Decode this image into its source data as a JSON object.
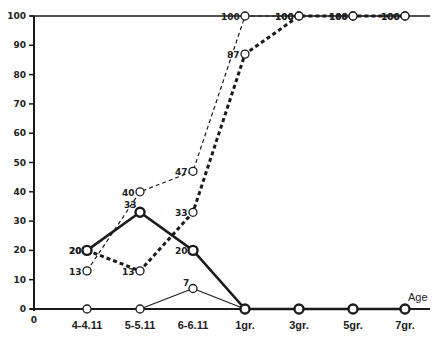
{
  "chart_data": {
    "type": "line",
    "title": "",
    "xlabel": "Age",
    "ylabel": "",
    "ylim": [
      0,
      100
    ],
    "yticks": [
      0,
      10,
      20,
      30,
      40,
      50,
      60,
      70,
      80,
      90,
      100
    ],
    "origin_label": "0",
    "categories": [
      "4-4.11",
      "5-5.11",
      "6-6.11",
      "1gr.",
      "3gr.",
      "5gr.",
      "7gr."
    ],
    "grid": false,
    "legend": null,
    "series": [
      {
        "name": "series-thin-dashed",
        "style": "thin-dashed",
        "values": [
          13,
          40,
          47,
          100,
          100,
          100,
          100
        ]
      },
      {
        "name": "series-thick-dashed",
        "style": "thick-dashed",
        "values": [
          20,
          13,
          33,
          87,
          100,
          100,
          100
        ]
      },
      {
        "name": "series-thick-solid",
        "style": "thick-solid",
        "values": [
          20,
          33,
          20,
          0,
          0,
          0,
          0
        ]
      },
      {
        "name": "series-thin-solid",
        "style": "thin-solid",
        "values": [
          0,
          0,
          7,
          0,
          0,
          0,
          0
        ]
      }
    ]
  },
  "colors": {
    "ink": "#1a1a1a",
    "background": "#ffffff"
  }
}
